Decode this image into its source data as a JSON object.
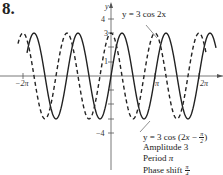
{
  "problem_number": "8.",
  "chart_data": {
    "type": "line",
    "title": "",
    "xlabel": "",
    "ylabel": "y",
    "xlim": [
      -6.6,
      7.0
    ],
    "ylim": [
      -4.2,
      4.6
    ],
    "x_ticks": [
      {
        "value": -6.2832,
        "label": "−2π"
      },
      {
        "value": 3.1416,
        "label": "π"
      },
      {
        "value": 6.2832,
        "label": "2π"
      }
    ],
    "y_ticks": [
      {
        "value": 4,
        "label": "4"
      },
      {
        "value": 3,
        "label": "3"
      },
      {
        "value": 1,
        "label": "1"
      },
      {
        "value": -4,
        "label": "−4"
      }
    ],
    "grid": false,
    "series": [
      {
        "name": "y = 3 cos 2x",
        "style": "dashed",
        "function": "3*cos(2x)",
        "amplitude": 3,
        "period": "π",
        "phase_shift": 0
      },
      {
        "name": "y = 3 cos (2x − π/2)",
        "style": "solid",
        "function": "3*cos(2x - pi/2)",
        "amplitude": 3,
        "period": "π",
        "phase_shift": "π/4"
      }
    ],
    "annotations": [
      "y = 3 cos 2x",
      "y = 3 cos (2x − π/2)",
      "Amplitude 3",
      "Period π",
      "Phase shift π/4"
    ]
  },
  "labels": {
    "y_axis": "y",
    "dashed_curve": "y = 3 cos 2x",
    "solid_curve_prefix": "y = 3 cos (2",
    "solid_curve_x": "x",
    "solid_curve_mid": " − ",
    "solid_curve_suffix": ")",
    "frac_pi": "π",
    "frac_2": "2",
    "frac_4": "4",
    "amplitude": "Amplitude 3",
    "period_prefix": "Period ",
    "period_value": "π",
    "phase_prefix": "Phase shift "
  }
}
